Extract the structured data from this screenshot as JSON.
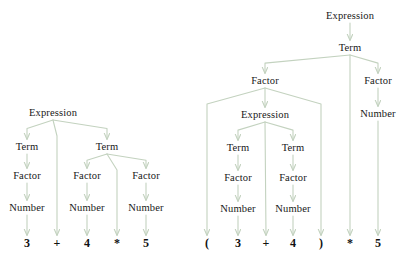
{
  "figure": {
    "title": "",
    "background": "#ffffff",
    "arrow_color": "#c3d2bf",
    "text_color": "#181818",
    "width": 405,
    "height": 256
  },
  "trees": [
    {
      "id": "left-tree",
      "expression": "3 + 4 * 5",
      "nodes": [
        {
          "id": "L-expr",
          "label": "Expression",
          "x": 53,
          "y": 113
        },
        {
          "id": "L-term1",
          "label": "Term",
          "x": 27,
          "y": 147
        },
        {
          "id": "L-term2",
          "label": "Term",
          "x": 107,
          "y": 147
        },
        {
          "id": "L-fac1",
          "label": "Factor",
          "x": 27,
          "y": 176
        },
        {
          "id": "L-fac2",
          "label": "Factor",
          "x": 87,
          "y": 176
        },
        {
          "id": "L-fac3",
          "label": "Factor",
          "x": 146,
          "y": 176
        },
        {
          "id": "L-num1",
          "label": "Number",
          "x": 27,
          "y": 208
        },
        {
          "id": "L-num2",
          "label": "Number",
          "x": 87,
          "y": 208
        },
        {
          "id": "L-num3",
          "label": "Number",
          "x": 146,
          "y": 208
        }
      ],
      "terminals": [
        {
          "id": "L-t1",
          "label": "3",
          "x": 27,
          "y": 243
        },
        {
          "id": "L-t2",
          "label": "+",
          "x": 57,
          "y": 243
        },
        {
          "id": "L-t3",
          "label": "4",
          "x": 87,
          "y": 243
        },
        {
          "id": "L-t4",
          "label": "*",
          "x": 117,
          "y": 243
        },
        {
          "id": "L-t5",
          "label": "5",
          "x": 146,
          "y": 243
        }
      ],
      "edges": [
        {
          "from": "L-expr",
          "to": "L-term1"
        },
        {
          "from": "L-expr",
          "to": "L-t2"
        },
        {
          "from": "L-expr",
          "to": "L-term2"
        },
        {
          "from": "L-term1",
          "to": "L-fac1"
        },
        {
          "from": "L-term2",
          "to": "L-fac2"
        },
        {
          "from": "L-term2",
          "to": "L-t4"
        },
        {
          "from": "L-term2",
          "to": "L-fac3"
        },
        {
          "from": "L-fac1",
          "to": "L-num1"
        },
        {
          "from": "L-fac2",
          "to": "L-num2"
        },
        {
          "from": "L-fac3",
          "to": "L-num3"
        },
        {
          "from": "L-num1",
          "to": "L-t1"
        },
        {
          "from": "L-num2",
          "to": "L-t3"
        },
        {
          "from": "L-num3",
          "to": "L-t5"
        }
      ]
    },
    {
      "id": "right-tree",
      "expression": "( 3 + 4 ) * 5",
      "nodes": [
        {
          "id": "R-expr0",
          "label": "Expression",
          "x": 350,
          "y": 16
        },
        {
          "id": "R-term0",
          "label": "Term",
          "x": 350,
          "y": 48
        },
        {
          "id": "R-facL",
          "label": "Factor",
          "x": 265,
          "y": 81
        },
        {
          "id": "R-facR",
          "label": "Factor",
          "x": 378,
          "y": 81
        },
        {
          "id": "R-expr1",
          "label": "Expression",
          "x": 265,
          "y": 115
        },
        {
          "id": "R-numR",
          "label": "Number",
          "x": 378,
          "y": 114
        },
        {
          "id": "R-term1",
          "label": "Term",
          "x": 238,
          "y": 148
        },
        {
          "id": "R-term2",
          "label": "Term",
          "x": 293,
          "y": 148
        },
        {
          "id": "R-fac1",
          "label": "Factor",
          "x": 238,
          "y": 178
        },
        {
          "id": "R-fac2",
          "label": "Factor",
          "x": 293,
          "y": 178
        },
        {
          "id": "R-num1",
          "label": "Number",
          "x": 238,
          "y": 209
        },
        {
          "id": "R-num2",
          "label": "Number",
          "x": 293,
          "y": 209
        }
      ],
      "terminals": [
        {
          "id": "R-t1",
          "label": "(",
          "x": 207,
          "y": 243
        },
        {
          "id": "R-t2",
          "label": "3",
          "x": 238,
          "y": 243
        },
        {
          "id": "R-t3",
          "label": "+",
          "x": 266,
          "y": 243
        },
        {
          "id": "R-t4",
          "label": "4",
          "x": 293,
          "y": 243
        },
        {
          "id": "R-t5",
          "label": ")",
          "x": 321,
          "y": 243
        },
        {
          "id": "R-t6",
          "label": "*",
          "x": 350,
          "y": 243
        },
        {
          "id": "R-t7",
          "label": "5",
          "x": 378,
          "y": 243
        }
      ],
      "edges": [
        {
          "from": "R-expr0",
          "to": "R-term0"
        },
        {
          "from": "R-term0",
          "to": "R-facL"
        },
        {
          "from": "R-term0",
          "to": "R-t6"
        },
        {
          "from": "R-term0",
          "to": "R-facR"
        },
        {
          "from": "R-facL",
          "to": "R-t1"
        },
        {
          "from": "R-facL",
          "to": "R-expr1"
        },
        {
          "from": "R-facL",
          "to": "R-t5"
        },
        {
          "from": "R-facR",
          "to": "R-numR"
        },
        {
          "from": "R-numR",
          "to": "R-t7"
        },
        {
          "from": "R-expr1",
          "to": "R-term1"
        },
        {
          "from": "R-expr1",
          "to": "R-t3"
        },
        {
          "from": "R-expr1",
          "to": "R-term2"
        },
        {
          "from": "R-term1",
          "to": "R-fac1"
        },
        {
          "from": "R-term2",
          "to": "R-fac2"
        },
        {
          "from": "R-fac1",
          "to": "R-num1"
        },
        {
          "from": "R-fac2",
          "to": "R-num2"
        },
        {
          "from": "R-num1",
          "to": "R-t2"
        },
        {
          "from": "R-num2",
          "to": "R-t4"
        }
      ]
    }
  ]
}
